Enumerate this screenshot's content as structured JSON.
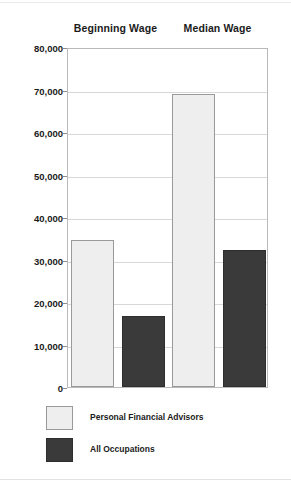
{
  "chart_data": {
    "type": "bar",
    "title": "",
    "subtitle": "",
    "xlabel": "",
    "ylabel": "",
    "categories": [
      "Beginning Wage",
      "Median Wage"
    ],
    "series": [
      {
        "name": "Personal Financial Advisors",
        "color": "#eeeeee",
        "values": [
          34500,
          69000
        ]
      },
      {
        "name": "All Occupations",
        "color": "#3a3a3a",
        "values": [
          16700,
          32200
        ]
      }
    ],
    "ylim": [
      0,
      80000
    ],
    "ytick_values": [
      0,
      10000,
      20000,
      30000,
      40000,
      50000,
      60000,
      70000,
      80000
    ],
    "ytick_labels": [
      "0",
      "10,000",
      "20,000",
      "30,000",
      "40,000",
      "50,000",
      "60,000",
      "70,000",
      "80,000"
    ],
    "grid": "horizontal",
    "legend_position": "bottom-left",
    "bar_order": [
      {
        "category": "Beginning Wage",
        "series": "Personal Financial Advisors",
        "value": 34500
      },
      {
        "category": "Beginning Wage",
        "series": "All Occupations",
        "value": 16700
      },
      {
        "category": "Median Wage",
        "series": "Personal Financial Advisors",
        "value": 69000
      },
      {
        "category": "Median Wage",
        "series": "All Occupations",
        "value": 32200
      }
    ]
  },
  "legend": {
    "items": [
      {
        "label": "Personal Financial Advisors",
        "swatch": "light"
      },
      {
        "label": "All Occupations",
        "swatch": "dark"
      }
    ]
  }
}
